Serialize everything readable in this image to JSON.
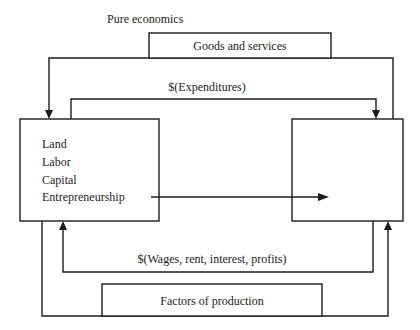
{
  "diagram": {
    "title": "Pure economics",
    "nodes": {
      "resource_owners": {
        "items": [
          "Land",
          "Labor",
          "Capital",
          "Entrepreneurship"
        ]
      },
      "firms": {
        "items": []
      }
    },
    "flows": {
      "goods": "Goods and services",
      "expenditures": "$(Expenditures)",
      "incomes": "$(Wages, rent, interest, profits)",
      "factors": "Factors of production"
    },
    "colors": {
      "line": "#1c1c1c",
      "background": "#ffffff"
    }
  }
}
